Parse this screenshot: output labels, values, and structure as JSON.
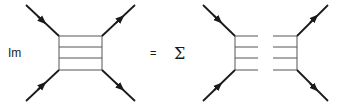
{
  "equation": {
    "lhs_operator": "Im",
    "equals": "=",
    "rhs_operator": "Σ"
  },
  "colors": {
    "line": "#1a1a1a",
    "rung": "#555555",
    "background": "#ffffff"
  },
  "left_diagram": {
    "description": "ladder diagram box with four external legs",
    "rungs": 4
  },
  "right_diagram": {
    "description": "cut ladder diagram (two halves) with four external legs",
    "rungs_per_half": 4
  }
}
